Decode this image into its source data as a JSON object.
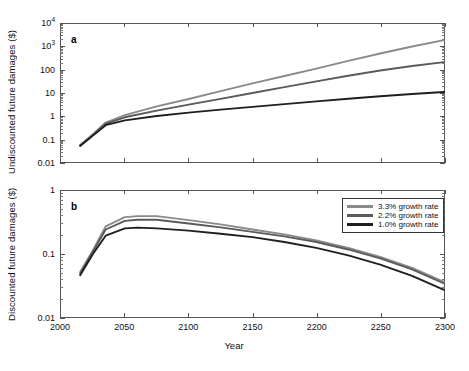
{
  "figure": {
    "xlabel": "Year",
    "panels": [
      {
        "letter": "a",
        "ylabel": "Undiscounted future damages ($)",
        "yticks": [
          "10⁴",
          "10³",
          "100",
          "10",
          "1",
          "0.1",
          "0.01"
        ]
      },
      {
        "letter": "b",
        "ylabel": "Discounted future damages ($)",
        "yticks": [
          "1",
          "0.1",
          "0.01"
        ]
      }
    ],
    "xticks": [
      "2000",
      "2050",
      "2100",
      "2150",
      "2200",
      "2250",
      "2300"
    ],
    "legend": {
      "position": "top-right-panel-b",
      "entries": [
        {
          "label": "3.3% growth rate",
          "color": "#8a8a8a"
        },
        {
          "label": "2.2% growth rate",
          "color": "#5a5a5a"
        },
        {
          "label": "1.0% growth rate",
          "color": "#1f1f1f"
        }
      ]
    }
  },
  "chart_data": [
    {
      "type": "line",
      "panel": "a",
      "title": "",
      "xlabel": "Year",
      "ylabel": "Undiscounted future damages ($)",
      "yscale": "log",
      "xlim": [
        2000,
        2300
      ],
      "ylim": [
        0.01,
        10000
      ],
      "grid": false,
      "legend_position": "none",
      "series": [
        {
          "name": "3.3% growth rate",
          "color": "#8a8a8a",
          "x": [
            2015,
            2025,
            2035,
            2050,
            2075,
            2100,
            2125,
            2150,
            2175,
            2200,
            2225,
            2250,
            2275,
            2300
          ],
          "y": [
            0.055,
            0.16,
            0.52,
            1.1,
            2.6,
            5.5,
            12,
            26,
            55,
            115,
            250,
            520,
            1050,
            2000
          ]
        },
        {
          "name": "2.2% growth rate",
          "color": "#5a5a5a",
          "x": [
            2015,
            2025,
            2035,
            2050,
            2075,
            2100,
            2125,
            2150,
            2175,
            2200,
            2225,
            2250,
            2275,
            2300
          ],
          "y": [
            0.052,
            0.15,
            0.46,
            0.88,
            1.7,
            3.1,
            5.6,
            10,
            18,
            32,
            56,
            95,
            150,
            220
          ]
        },
        {
          "name": "1.0% growth rate",
          "color": "#1f1f1f",
          "x": [
            2015,
            2025,
            2035,
            2050,
            2075,
            2100,
            2125,
            2150,
            2175,
            2200,
            2225,
            2250,
            2275,
            2300
          ],
          "y": [
            0.05,
            0.14,
            0.4,
            0.65,
            1.0,
            1.4,
            1.9,
            2.5,
            3.3,
            4.3,
            5.6,
            7.2,
            9.0,
            11.0
          ]
        }
      ]
    },
    {
      "type": "line",
      "panel": "b",
      "title": "",
      "xlabel": "Year",
      "ylabel": "Discounted future damages ($)",
      "yscale": "log",
      "xlim": [
        2000,
        2300
      ],
      "ylim": [
        0.01,
        1
      ],
      "grid": false,
      "legend_position": "upper right",
      "series": [
        {
          "name": "3.3% growth rate",
          "color": "#8a8a8a",
          "x": [
            2015,
            2025,
            2035,
            2050,
            2060,
            2075,
            2100,
            2125,
            2150,
            2175,
            2200,
            2225,
            2250,
            2275,
            2300
          ],
          "y": [
            0.052,
            0.115,
            0.275,
            0.385,
            0.4,
            0.4,
            0.345,
            0.295,
            0.245,
            0.205,
            0.165,
            0.125,
            0.09,
            0.06,
            0.036
          ]
        },
        {
          "name": "2.2% growth rate",
          "color": "#5a5a5a",
          "x": [
            2015,
            2025,
            2035,
            2050,
            2060,
            2075,
            2100,
            2125,
            2150,
            2175,
            2200,
            2225,
            2250,
            2275,
            2300
          ],
          "y": [
            0.049,
            0.108,
            0.245,
            0.335,
            0.35,
            0.35,
            0.305,
            0.265,
            0.225,
            0.19,
            0.155,
            0.118,
            0.085,
            0.057,
            0.034
          ]
        },
        {
          "name": "1.0% growth rate",
          "color": "#1f1f1f",
          "x": [
            2015,
            2025,
            2035,
            2050,
            2060,
            2075,
            2100,
            2125,
            2150,
            2175,
            2200,
            2225,
            2250,
            2275,
            2300
          ],
          "y": [
            0.046,
            0.1,
            0.195,
            0.255,
            0.262,
            0.255,
            0.235,
            0.21,
            0.185,
            0.155,
            0.125,
            0.095,
            0.068,
            0.045,
            0.027
          ]
        }
      ]
    }
  ]
}
